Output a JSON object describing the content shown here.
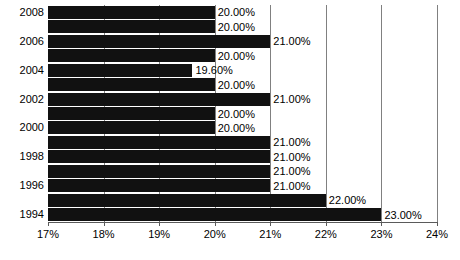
{
  "chart_data": {
    "type": "bar",
    "orientation": "horizontal",
    "title": "",
    "xlabel": "",
    "ylabel": "",
    "xlim": [
      17,
      24
    ],
    "grid": true,
    "legend": null,
    "categories": [
      "2008",
      "2007",
      "2006",
      "2005",
      "2004",
      "2003",
      "2002",
      "2001",
      "2000",
      "1999",
      "1998",
      "1997",
      "1996",
      "1995",
      "1994"
    ],
    "category_labels_shown": [
      "2008",
      "",
      "2006",
      "",
      "2004",
      "",
      "2002",
      "",
      "2000",
      "",
      "1998",
      "",
      "1996",
      "",
      "1994"
    ],
    "values": [
      20.0,
      20.0,
      21.0,
      20.0,
      19.6,
      20.0,
      21.0,
      20.0,
      20.0,
      21.0,
      21.0,
      21.0,
      21.0,
      22.0,
      23.0
    ],
    "data_labels": [
      "20.00%",
      "20.00%",
      "21.00%",
      "20.00%",
      "19.60%",
      "20.00%",
      "21.00%",
      "20.00%",
      "20.00%",
      "21.00%",
      "21.00%",
      "21.00%",
      "21.00%",
      "22.00%",
      "23.00%"
    ],
    "xticks": [
      17,
      18,
      19,
      20,
      21,
      22,
      23,
      24
    ],
    "xtick_labels": [
      "17%",
      "18%",
      "19%",
      "20%",
      "21%",
      "22%",
      "23%",
      "24%"
    ],
    "bar_color": "#111111",
    "grid_color": "#808080",
    "axis_color": "#5a5a5a",
    "text_color": "#000000",
    "background": "#ffffff"
  }
}
